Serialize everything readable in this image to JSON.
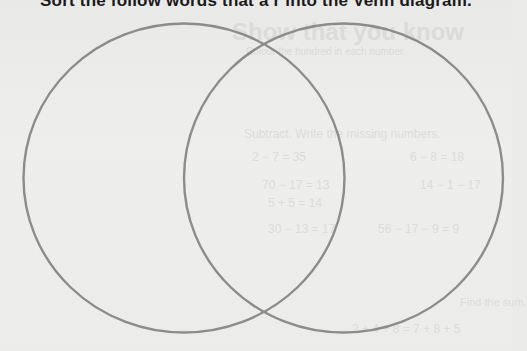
{
  "worksheet": {
    "instruction": "Sort the follow words that a r into the Venn diagram."
  },
  "venn": {
    "circle_count": 2,
    "stroke_color": "#8c8c8c",
    "background_color": "#ebebea",
    "left_circle": {
      "label": ""
    },
    "right_circle": {
      "label": ""
    }
  },
  "bleed_through": {
    "heading": "Show that you know",
    "line1": "Colour the hundred in each number.",
    "line2": "Subtract. Write the missing numbers.",
    "row1_left": "2 − 7 = 35",
    "row1_right": "6 − 8 = 18",
    "row2_left": "70 − 17 = 13",
    "row2_right": "14 − 1 − 17",
    "row3": "5 + 5 = 14",
    "row4_left": "30 − 13 = 17",
    "row4_right": "56 − 17 − 9 = 9",
    "line3": "Find the sum.",
    "row5": "2 + 4 + 8 = 7 + 8 + 5"
  }
}
